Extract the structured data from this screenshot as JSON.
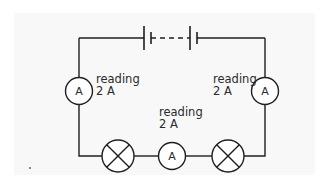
{
  "diagram": {
    "type": "series circuit",
    "colors": {
      "wire": "#1f1f1f",
      "text": "#2a2a2a",
      "panel": "#f8f8f8"
    },
    "battery": {
      "symbol": "battery-of-cells",
      "cells": 2,
      "connector": "dashed"
    },
    "ammeters": [
      {
        "id": "left",
        "symbol": "A",
        "label_line1": "reading",
        "label_line2": "2 A"
      },
      {
        "id": "right",
        "symbol": "A",
        "label_line1": "reading",
        "label_line2": "2 A"
      },
      {
        "id": "bottom",
        "symbol": "A",
        "label_line1": "reading",
        "label_line2": "2 A"
      }
    ],
    "lamps": [
      {
        "id": "lamp-left",
        "symbol": "lamp"
      },
      {
        "id": "lamp-right",
        "symbol": "lamp"
      }
    ]
  }
}
